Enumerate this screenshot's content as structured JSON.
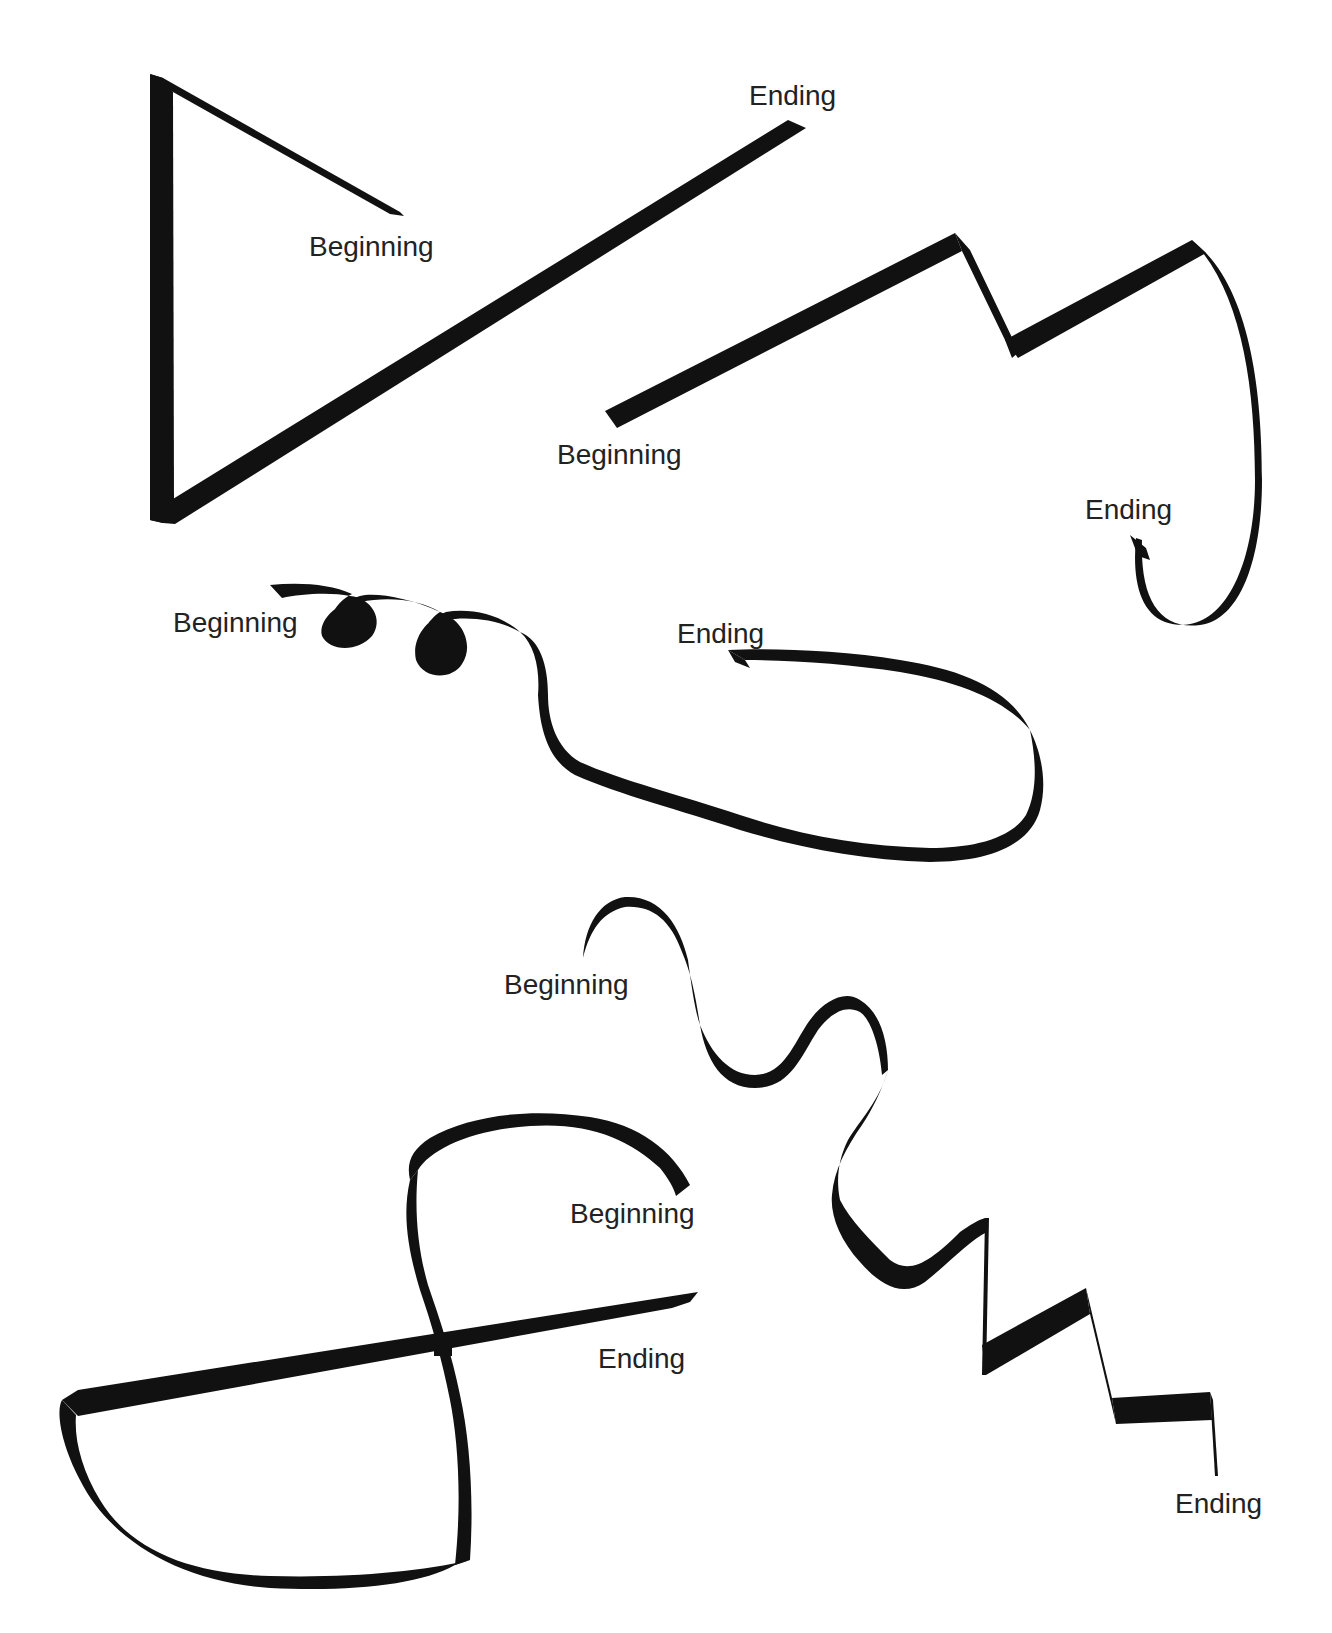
{
  "figure": {
    "background": "#ffffff",
    "ink_color": "#111111",
    "label_color": "#222222",
    "ribbons": [
      {
        "id": "ribbon-1-triangle",
        "shape": "triangle with long diagonal",
        "begin_label": "Beginning",
        "end_label": "Ending"
      },
      {
        "id": "ribbon-2-zigzag-hook",
        "shape": "zigzag rising then hooking down",
        "begin_label": "Beginning",
        "end_label": "Ending"
      },
      {
        "id": "ribbon-3-curls-loop",
        "shape": "two curls then a large loop",
        "begin_label": "Beginning",
        "end_label": "Ending"
      },
      {
        "id": "ribbon-4-wave-steps",
        "shape": "wavy descent into stair steps",
        "begin_label": "Beginning",
        "end_label": "Ending"
      },
      {
        "id": "ribbon-5-figure-eight",
        "shape": "S-curve crossing a straight line",
        "begin_label": "Beginning",
        "end_label": "Ending"
      }
    ]
  }
}
